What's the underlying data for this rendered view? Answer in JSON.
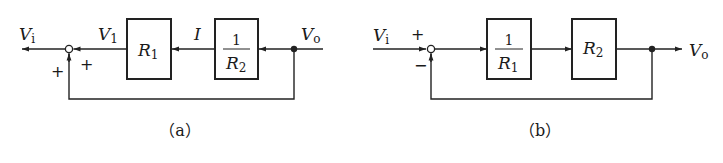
{
  "diagrams": [
    {
      "id": "a",
      "caption": "（a）",
      "input_label": {
        "main": "V",
        "sub": "i"
      },
      "output_label": {
        "main": "V",
        "sub": "o"
      },
      "intermediate_label": {
        "main": "V",
        "sub": "1"
      },
      "current_label": "I",
      "sum_signs": {
        "left": "+",
        "right": "+"
      },
      "blocks": [
        {
          "name": "R1-block",
          "main": "R",
          "sub": "1",
          "type": "plain"
        },
        {
          "name": "inverse-R2-block",
          "num": "1",
          "den_main": "R",
          "den_sub": "2",
          "type": "fraction"
        }
      ],
      "flow_direction": "right-to-left",
      "feedback": "positive"
    },
    {
      "id": "b",
      "caption": "（b）",
      "input_label": {
        "main": "V",
        "sub": "i"
      },
      "output_label": {
        "main": "V",
        "sub": "o"
      },
      "sum_signs": {
        "top": "+",
        "bottom": "−"
      },
      "blocks": [
        {
          "name": "inverse-R1-block",
          "num": "1",
          "den_main": "R",
          "den_sub": "1",
          "type": "fraction"
        },
        {
          "name": "R2-block",
          "main": "R",
          "sub": "2",
          "type": "plain"
        }
      ],
      "flow_direction": "left-to-right",
      "feedback": "negative"
    }
  ]
}
